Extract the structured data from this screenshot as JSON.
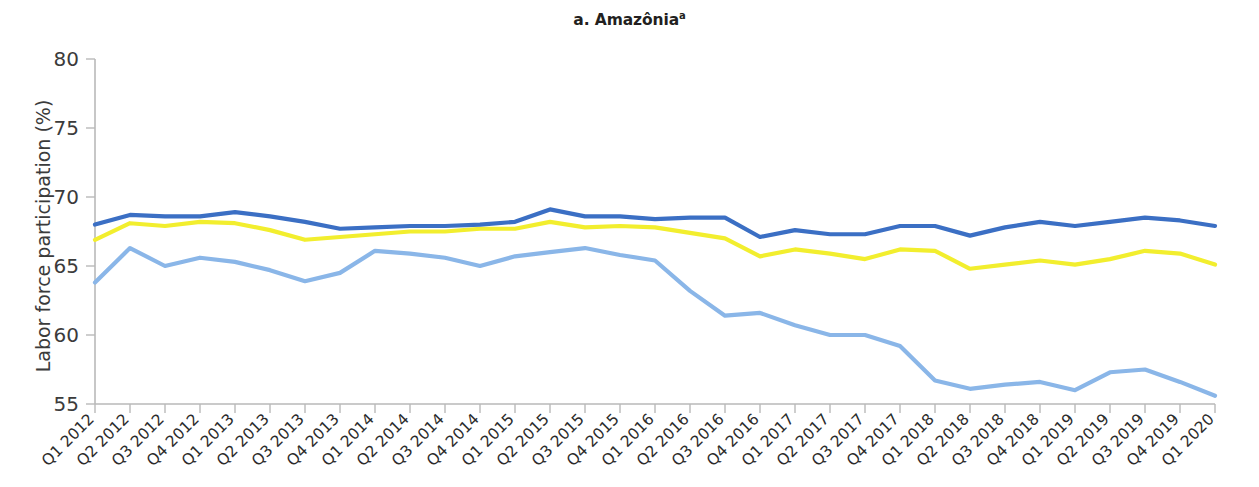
{
  "chart_data": {
    "type": "line",
    "title": "a. Amazônia",
    "title_superscript": "a",
    "xlabel": "",
    "ylabel": "Labor force participation (%)",
    "ylim": [
      55,
      80
    ],
    "yticks": [
      55,
      60,
      65,
      70,
      75,
      80
    ],
    "grid": false,
    "legend_position": "none",
    "categories": [
      "Q1 2012",
      "Q2 2012",
      "Q3 2012",
      "Q4 2012",
      "Q1 2013",
      "Q2 2013",
      "Q3 2013",
      "Q4 2013",
      "Q1 2014",
      "Q2 2014",
      "Q3 2014",
      "Q4 2014",
      "Q1 2015",
      "Q2 2015",
      "Q3 2015",
      "Q4 2015",
      "Q1 2016",
      "Q2 2016",
      "Q3 2016",
      "Q4 2016",
      "Q1 2017",
      "Q2 2017",
      "Q3 2017",
      "Q4 2017",
      "Q1 2018",
      "Q2 2018",
      "Q3 2018",
      "Q4 2018",
      "Q1 2019",
      "Q2 2019",
      "Q3 2019",
      "Q4 2019",
      "Q1 2020"
    ],
    "series": [
      {
        "name": "series-dark-blue",
        "color": "#3b6fc4",
        "values": [
          68.0,
          68.7,
          68.6,
          68.6,
          68.9,
          68.6,
          68.2,
          67.7,
          67.8,
          67.9,
          67.9,
          68.0,
          68.2,
          69.1,
          68.6,
          68.6,
          68.4,
          68.5,
          68.5,
          67.1,
          67.6,
          67.3,
          67.3,
          67.9,
          67.9,
          67.2,
          67.8,
          68.2,
          67.9,
          68.2,
          68.5,
          68.3,
          67.9
        ]
      },
      {
        "name": "series-yellow",
        "color": "#f2ee2e",
        "values": [
          66.9,
          68.1,
          67.9,
          68.2,
          68.1,
          67.6,
          66.9,
          67.1,
          67.3,
          67.5,
          67.5,
          67.7,
          67.7,
          68.2,
          67.8,
          67.9,
          67.8,
          67.4,
          67.0,
          65.7,
          66.2,
          65.9,
          65.5,
          66.2,
          66.1,
          64.8,
          65.1,
          65.4,
          65.1,
          65.5,
          66.1,
          65.9,
          65.1
        ]
      },
      {
        "name": "series-light-blue",
        "color": "#8ab6e8",
        "values": [
          63.8,
          66.3,
          65.0,
          65.6,
          65.3,
          64.7,
          63.9,
          64.5,
          66.1,
          65.9,
          65.6,
          65.0,
          65.7,
          66.0,
          66.3,
          65.8,
          65.4,
          63.2,
          61.4,
          61.6,
          60.7,
          60.0,
          60.0,
          59.2,
          56.7,
          56.1,
          56.4,
          56.6,
          56.0,
          57.3,
          57.5,
          56.6,
          55.6
        ]
      }
    ]
  }
}
